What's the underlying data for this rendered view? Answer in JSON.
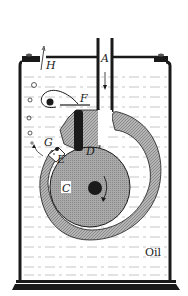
{
  "diagram": {
    "labels": {
      "A": "A",
      "B": "B",
      "C": "C",
      "D": "D",
      "E": "E",
      "F": "F",
      "G": "G",
      "H": "H",
      "oil": "Oil"
    },
    "components": [
      {
        "id": "A",
        "description": "inlet tube (gas flows downward)"
      },
      {
        "id": "B",
        "description": "pump housing / stator cavity"
      },
      {
        "id": "C",
        "description": "eccentric rotor"
      },
      {
        "id": "D",
        "description": "sliding vane"
      },
      {
        "id": "E",
        "description": "exhaust valve"
      },
      {
        "id": "F",
        "description": "spring"
      },
      {
        "id": "G",
        "description": "exhaust port"
      },
      {
        "id": "H",
        "description": "exhaust vent"
      },
      {
        "id": "oil",
        "description": "oil bath"
      }
    ],
    "colors": {
      "ink": "#1a1a1a",
      "hatch_fill": "#9a9a9a",
      "rotor_fill": "#a8a8a8",
      "background": "#ffffff",
      "oil_lines": "#b0b0b0"
    }
  }
}
